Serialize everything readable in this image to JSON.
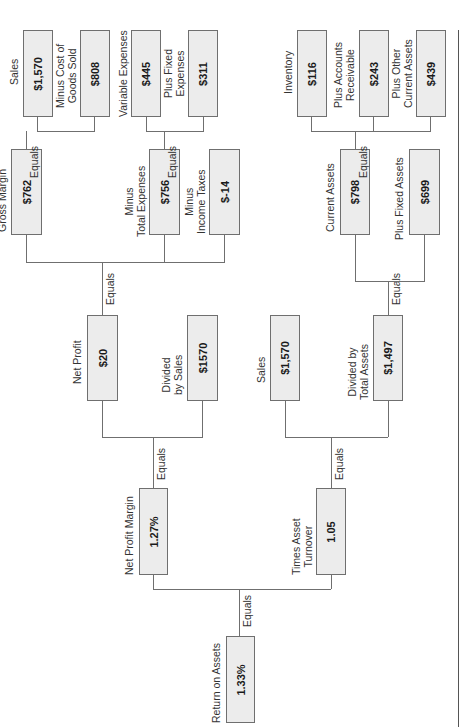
{
  "diagram": {
    "orientation": "rotated-90-ccw",
    "nodes": {
      "roa": {
        "label": "Return on Assets",
        "value": "1.33%"
      },
      "npm": {
        "label": "Net Profit Margin",
        "value": "1.27%"
      },
      "tat": {
        "label": "Times Asset Turnover",
        "value": "1.05"
      },
      "net_profit": {
        "label": "Net Profit",
        "value": "$20"
      },
      "div_sales": {
        "label_line1": "Divided",
        "label_line2": "by Sales",
        "value": "$1570"
      },
      "sales_mid": {
        "label": "Sales",
        "value": "$1,570"
      },
      "div_total_assets": {
        "label_line1": "Divided by",
        "label_line2": "Total Assets",
        "value": "$1,497"
      },
      "gross_margin": {
        "label": "Gross Margin",
        "value": "$762"
      },
      "total_expenses": {
        "label_line1": "Minus",
        "label_line2": "Total Expenses",
        "value": "$756"
      },
      "income_taxes": {
        "label_line1": "Minus",
        "label_line2": "Income Taxes",
        "value": "$-14"
      },
      "current_assets": {
        "label": "Current Assets",
        "value": "$798"
      },
      "fixed_assets": {
        "label": "Plus Fixed Assets",
        "value": "$699"
      },
      "sales_top": {
        "label": "Sales",
        "value": "$1,570"
      },
      "cogs": {
        "label_line1": "Minus Cost of",
        "label_line2": "Goods Sold",
        "value": "$808"
      },
      "variable_expenses": {
        "label": "Variable Expenses",
        "value": "$445"
      },
      "fixed_expenses": {
        "label_line1": "Plus Fixed",
        "label_line2": "Expenses",
        "value": "$311"
      },
      "inventory": {
        "label": "Inventory",
        "value": "$116"
      },
      "accounts_receivable": {
        "label_line1": "Plus Accounts",
        "label_line2": "Receivable",
        "value": "$243"
      },
      "other_current_assets": {
        "label_line1": "Plus Other",
        "label_line2": "Current Assets",
        "value": "$439"
      }
    },
    "connector_label": "Equals"
  }
}
